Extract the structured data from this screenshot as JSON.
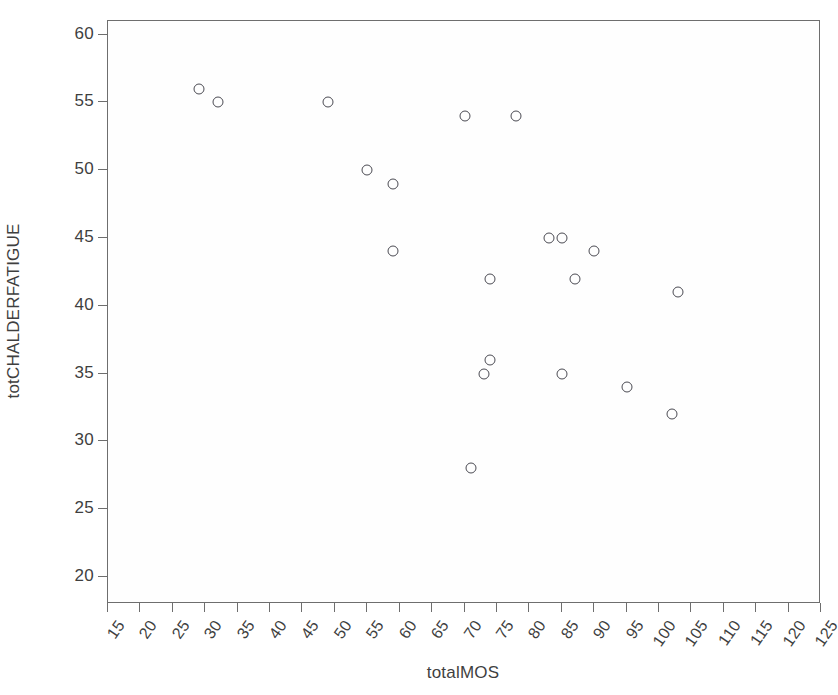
{
  "chart_data": {
    "type": "scatter",
    "title": "",
    "xlabel": "totalMOS",
    "ylabel": "totCHALDERFATIGUE",
    "xlim": [
      15,
      125
    ],
    "ylim": [
      18,
      61
    ],
    "xticks": [
      15,
      20,
      25,
      30,
      35,
      40,
      45,
      50,
      55,
      60,
      65,
      70,
      75,
      80,
      85,
      90,
      95,
      100,
      105,
      110,
      115,
      120,
      125
    ],
    "yticks": [
      20,
      25,
      30,
      35,
      40,
      45,
      50,
      55,
      60
    ],
    "grid": false,
    "legend": null,
    "marker": {
      "shape": "open-circle",
      "edge_color": "#4a4a52",
      "fill": "none",
      "size": 11
    },
    "axis_color": "#6e6e6e",
    "background": "#ffffff",
    "n_points": 19,
    "points": [
      {
        "x": 29,
        "y": 56
      },
      {
        "x": 32,
        "y": 55
      },
      {
        "x": 49,
        "y": 55
      },
      {
        "x": 70,
        "y": 54
      },
      {
        "x": 78,
        "y": 54
      },
      {
        "x": 55,
        "y": 50
      },
      {
        "x": 59,
        "y": 49
      },
      {
        "x": 59,
        "y": 44
      },
      {
        "x": 83,
        "y": 45
      },
      {
        "x": 85,
        "y": 45
      },
      {
        "x": 90,
        "y": 44
      },
      {
        "x": 74,
        "y": 42
      },
      {
        "x": 87,
        "y": 42
      },
      {
        "x": 103,
        "y": 41
      },
      {
        "x": 74,
        "y": 36
      },
      {
        "x": 73,
        "y": 35
      },
      {
        "x": 85,
        "y": 35
      },
      {
        "x": 95,
        "y": 34
      },
      {
        "x": 102,
        "y": 32
      },
      {
        "x": 71,
        "y": 28
      }
    ]
  }
}
